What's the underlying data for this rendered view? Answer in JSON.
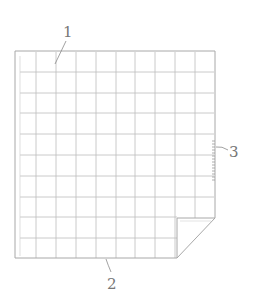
{
  "diagram": {
    "type": "patent-figure",
    "frame": {
      "x": 15,
      "y": 51,
      "width": 200,
      "height": 207
    },
    "grid": {
      "columns": 10,
      "rows": 10
    },
    "fold_corner": {
      "x": 177,
      "y": 218
    },
    "perforation": {
      "x": 215,
      "y_start": 140,
      "y_end": 182
    },
    "colors": {
      "line": "#b8b8b8",
      "frame": "#a8a8a8",
      "label": "#777777"
    },
    "labels": [
      {
        "id": "label-1",
        "text": "1",
        "x": 68,
        "y": 37
      },
      {
        "id": "label-2",
        "text": "2",
        "x": 112,
        "y": 288
      },
      {
        "id": "label-3",
        "text": "3",
        "x": 233,
        "y": 157
      }
    ]
  }
}
